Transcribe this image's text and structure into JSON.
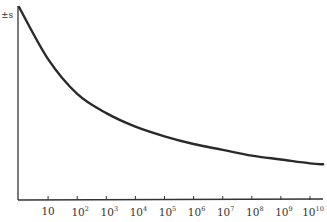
{
  "chart_data": {
    "type": "line",
    "title": "",
    "xlabel": "",
    "ylabel": "±s",
    "x_scale": "log",
    "x_ticks": [
      "10",
      "10^2",
      "10^3",
      "10^4",
      "10^5",
      "10^6",
      "10^7",
      "10^8",
      "10^9",
      "10^10"
    ],
    "grid": false,
    "legend": null,
    "series": [
      {
        "name": "±s",
        "x_log10": [
          0,
          1,
          2,
          3,
          4,
          5,
          6,
          7,
          8,
          9,
          10,
          10.45
        ],
        "y_relative": [
          1.0,
          0.73,
          0.55,
          0.45,
          0.38,
          0.33,
          0.29,
          0.26,
          0.23,
          0.21,
          0.19,
          0.185
        ]
      }
    ],
    "ylim": [
      0,
      1
    ],
    "xlim_log10": [
      0,
      10.5
    ]
  },
  "axis": {
    "y_label": "±s",
    "x_ticks": [
      {
        "base": "10",
        "exp": ""
      },
      {
        "base": "10",
        "exp": "2"
      },
      {
        "base": "10",
        "exp": "3"
      },
      {
        "base": "10",
        "exp": "4"
      },
      {
        "base": "10",
        "exp": "5"
      },
      {
        "base": "10",
        "exp": "6"
      },
      {
        "base": "10",
        "exp": "7"
      },
      {
        "base": "10",
        "exp": "8"
      },
      {
        "base": "10",
        "exp": "9"
      },
      {
        "base": "10",
        "exp": "10"
      }
    ]
  },
  "colors": {
    "line": "#2a2a2a",
    "axis": "#333333",
    "background": "#ffffff"
  }
}
